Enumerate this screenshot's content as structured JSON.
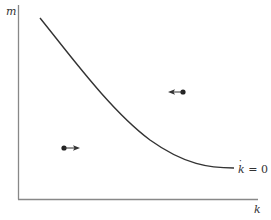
{
  "diagram": {
    "type": "phase-diagram",
    "axes": {
      "y_label": "m",
      "x_label": "k"
    },
    "curve": {
      "label_var": "k",
      "label_rest": " = 0",
      "label_full": "k̇ = 0",
      "description": "downward-sloping convex locus"
    },
    "markers": [
      {
        "name": "lower-left-point",
        "direction": "right",
        "meaning": "k increasing below locus"
      },
      {
        "name": "upper-right-point",
        "direction": "left",
        "meaning": "k decreasing above locus"
      }
    ],
    "colors": {
      "line": "#333333",
      "axis": "#888888",
      "background": "#ffffff"
    }
  }
}
